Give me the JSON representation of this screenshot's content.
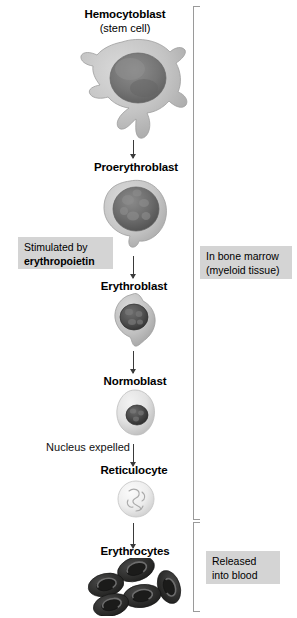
{
  "diagram": {
    "stages": [
      {
        "id": "hemocytoblast",
        "label": "Hemocytoblast",
        "sublabel": "(stem cell)",
        "icon": "hemocytoblast-cell"
      },
      {
        "id": "proerythroblast",
        "label": "Proerythroblast",
        "sublabel": "",
        "icon": "proerythroblast-cell"
      },
      {
        "id": "erythroblast",
        "label": "Erythroblast",
        "sublabel": "",
        "icon": "erythroblast-cell"
      },
      {
        "id": "normoblast",
        "label": "Normoblast",
        "sublabel": "",
        "icon": "normoblast-cell"
      },
      {
        "id": "reticulocyte",
        "label": "Reticulocyte",
        "sublabel": "",
        "icon": "reticulocyte-cell"
      },
      {
        "id": "erythrocytes",
        "label": "Erythrocytes",
        "sublabel": "",
        "icon": "erythrocytes-cells"
      }
    ],
    "annotations": {
      "stimulated_line1": "Stimulated by",
      "stimulated_line2": "erythropoietin",
      "nucleus_expelled": "Nucleus expelled",
      "bone_marrow_line1": "In bone marrow",
      "bone_marrow_line2": "(myeloid tissue)",
      "released_line1": "Released",
      "released_line2": "into blood"
    },
    "colors": {
      "box_background": "#d4d4d4",
      "bracket": "#9a9a9a",
      "arrow": "#3a3a3a",
      "text": "#000000",
      "erythrocyte": "#2b2b2b",
      "cytoplasm": "#c9c9c9",
      "nucleus": "#6f6f6f"
    }
  }
}
